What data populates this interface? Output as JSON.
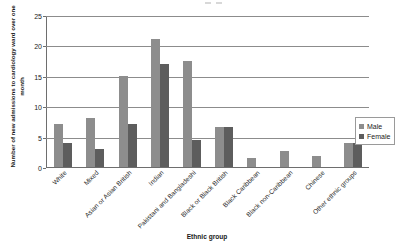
{
  "chart_data": {
    "type": "bar",
    "title": "",
    "xlabel": "Ethnic group",
    "ylabel": "Number of new admissions to cardiology ward over one month",
    "ylim": [
      0,
      25
    ],
    "yticks": [
      0,
      5,
      10,
      15,
      20,
      25
    ],
    "grid": true,
    "legend_position": "right",
    "categories": [
      "White",
      "Mixed",
      "Asian or Asian British",
      "Indian",
      "Pakistani and Bangladeshi",
      "Black or Black British",
      "Black Caribbean",
      "Black non-Caribbean",
      "Chinese",
      "Other ethnic groups"
    ],
    "series": [
      {
        "name": "Male",
        "color": "#8d8d8d",
        "values": [
          7,
          8,
          15,
          21,
          17.5,
          6.5,
          1.5,
          2.7,
          1.8,
          4
        ]
      },
      {
        "name": "Female",
        "color": "#5d5d5d",
        "values": [
          4,
          3,
          7,
          17,
          4.5,
          6.5,
          0,
          0,
          0,
          4
        ]
      }
    ]
  },
  "legend": {
    "items": [
      {
        "label": "Male"
      },
      {
        "label": "Female"
      }
    ]
  },
  "axis": {
    "y_title": "Number of new admissions to cardiology ward over one month",
    "x_title": "Ethnic group",
    "y_tick_labels": [
      "0",
      "5",
      "10",
      "15",
      "20",
      "25"
    ]
  }
}
